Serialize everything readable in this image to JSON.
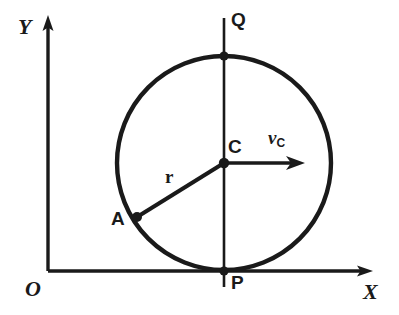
{
  "figure": {
    "background_color": "#ffffff",
    "stroke_color": "#1a1a1a",
    "width": 399,
    "height": 315
  },
  "axes": {
    "x_label": "X",
    "y_label": "Y",
    "origin_label": "O",
    "origin": {
      "x": 48,
      "y": 271
    },
    "x_axis": {
      "x1": 48,
      "y1": 271,
      "x2": 372,
      "y2": 271,
      "arrow": "right"
    },
    "y_axis": {
      "x1": 48,
      "y1": 271,
      "x2": 48,
      "y2": 18,
      "arrow": "up"
    }
  },
  "circle": {
    "center": {
      "x": 224,
      "y": 163
    },
    "radius": 107,
    "stroke_width": 4
  },
  "points": [
    {
      "name": "C",
      "label": "C",
      "x": 224,
      "y": 163,
      "dot": true
    },
    {
      "name": "Q",
      "label": "Q",
      "x": 224,
      "y": 56,
      "dot": true
    },
    {
      "name": "P",
      "label": "P",
      "x": 224,
      "y": 271,
      "dot": true
    },
    {
      "name": "A",
      "label": "A",
      "x": 137,
      "y": 217,
      "dot": true
    }
  ],
  "segments": {
    "vertical_chord": {
      "x1": 224,
      "y1": 18,
      "x2": 224,
      "y2": 287,
      "label_top": "Q",
      "label_bottom": "P"
    },
    "radius_to_A": {
      "x1": 224,
      "y1": 163,
      "x2": 137,
      "y2": 217,
      "label": "r"
    }
  },
  "vectors": [
    {
      "name": "velocity-of-center",
      "symbol": "v",
      "subscript": "C",
      "from": {
        "x": 224,
        "y": 163
      },
      "to": {
        "x": 305,
        "y": 163
      },
      "direction": "right"
    }
  ],
  "labels": {
    "r": "r",
    "v_symbol": "v",
    "v_subscript": "C"
  }
}
